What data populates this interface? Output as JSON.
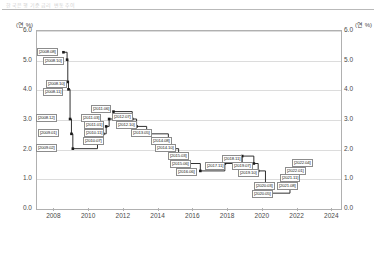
{
  "header": {
    "ghost_text": "한국은행 기준금리 변동추이"
  },
  "axis": {
    "unit_left": "(연 %)",
    "unit_right": "(연 %)",
    "y_ticks": [
      "6.0",
      "5.0",
      "4.0",
      "3.0",
      "2.0",
      "1.0",
      "0.0"
    ],
    "x_ticks": [
      "2008",
      "2010",
      "2012",
      "2014",
      "2016",
      "2018",
      "2020",
      "2022",
      "2024"
    ]
  },
  "chart_data": {
    "type": "line",
    "title": "",
    "subtitle": "",
    "xlabel": "",
    "ylabel": "(연 %)",
    "ylim": [
      0.0,
      6.0
    ],
    "xlim": [
      2007.0,
      2024.5
    ],
    "grid": true,
    "legend": null,
    "step": "post",
    "line_color": "#1a1a1a",
    "marker": "square",
    "series": [
      {
        "name": "한국은행 기준금리",
        "points": [
          {
            "label": "[2008.08]",
            "date": 2008.58,
            "value": 5.25
          },
          {
            "label": "[2008.10]",
            "date": 2008.79,
            "value": 5.0
          },
          {
            "label": "[2008.10]",
            "date": 2008.83,
            "value": 4.25
          },
          {
            "label": "[2008.11]",
            "date": 2008.87,
            "value": 4.0
          },
          {
            "label": "[2008.12]",
            "date": 2008.96,
            "value": 3.0
          },
          {
            "label": "[2009.01]",
            "date": 2009.04,
            "value": 2.5
          },
          {
            "label": "[2009.02]",
            "date": 2009.12,
            "value": 2.0
          },
          {
            "label": "[2010.07]",
            "date": 2010.54,
            "value": 2.25
          },
          {
            "label": "[2010.11]",
            "date": 2010.87,
            "value": 2.5
          },
          {
            "label": "[2011.01]",
            "date": 2011.04,
            "value": 2.75
          },
          {
            "label": "[2011.03]",
            "date": 2011.21,
            "value": 3.0
          },
          {
            "label": "[2011.06]",
            "date": 2011.46,
            "value": 3.25
          },
          {
            "label": "[2012.07]",
            "date": 2012.54,
            "value": 3.0
          },
          {
            "label": "[2012.10]",
            "date": 2012.79,
            "value": 2.75
          },
          {
            "label": "[2013.05]",
            "date": 2013.37,
            "value": 2.5
          },
          {
            "label": "[2014.08]",
            "date": 2014.62,
            "value": 2.25
          },
          {
            "label": "[2014.10]",
            "date": 2014.79,
            "value": 2.0
          },
          {
            "label": "[2015.03]",
            "date": 2015.21,
            "value": 1.75
          },
          {
            "label": "[2015.06]",
            "date": 2015.46,
            "value": 1.5
          },
          {
            "label": "[2016.06]",
            "date": 2016.46,
            "value": 1.25
          },
          {
            "label": "[2017.11]",
            "date": 2017.87,
            "value": 1.5
          },
          {
            "label": "[2018.11]",
            "date": 2018.87,
            "value": 1.75
          },
          {
            "label": "[2019.07]",
            "date": 2019.54,
            "value": 1.5
          },
          {
            "label": "[2019.10]",
            "date": 2019.79,
            "value": 1.25
          },
          {
            "label": "[2020.03]",
            "date": 2020.21,
            "value": 0.75
          },
          {
            "label": "[2020.05]",
            "date": 2020.37,
            "value": 0.5
          },
          {
            "label": "[2021.08]",
            "date": 2021.62,
            "value": 0.75
          },
          {
            "label": "[2021.11]",
            "date": 2021.87,
            "value": 1.0
          },
          {
            "label": "[2022.01]",
            "date": 2022.04,
            "value": 1.25
          },
          {
            "label": "[2022.04]",
            "date": 2022.29,
            "value": 1.5
          }
        ]
      }
    ]
  },
  "annotations": [
    {
      "text": "[2008.08]",
      "x": 37,
      "y": 48
    },
    {
      "text": "[2008.10]",
      "x": 43,
      "y": 57
    },
    {
      "text": "[2008.10]",
      "x": 46,
      "y": 80
    },
    {
      "text": "[2008.11]",
      "x": 43,
      "y": 88
    },
    {
      "text": "[2008.12]",
      "x": 36,
      "y": 114
    },
    {
      "text": "[2009.01]",
      "x": 38,
      "y": 129
    },
    {
      "text": "[2009.02]",
      "x": 36,
      "y": 144
    },
    {
      "text": "[2010.07]",
      "x": 83,
      "y": 137
    },
    {
      "text": "[2010.11]",
      "x": 84,
      "y": 129
    },
    {
      "text": "[2011.01]",
      "x": 84,
      "y": 121
    },
    {
      "text": "[2011.03]",
      "x": 81,
      "y": 114
    },
    {
      "text": "[2011.06]",
      "x": 91,
      "y": 105
    },
    {
      "text": "[2012.07]",
      "x": 112,
      "y": 113
    },
    {
      "text": "[2012.10]",
      "x": 116,
      "y": 121
    },
    {
      "text": "[2013.05]",
      "x": 131,
      "y": 129
    },
    {
      "text": "[2014.08]",
      "x": 151,
      "y": 137
    },
    {
      "text": "[2014.10]",
      "x": 155,
      "y": 144
    },
    {
      "text": "[2015.03]",
      "x": 168,
      "y": 152
    },
    {
      "text": "[2015.06]",
      "x": 170,
      "y": 160
    },
    {
      "text": "[2016.06]",
      "x": 176,
      "y": 168
    },
    {
      "text": "[2017.11]",
      "x": 205,
      "y": 162
    },
    {
      "text": "[2018.11]",
      "x": 222,
      "y": 155
    },
    {
      "text": "[2019.07]",
      "x": 232,
      "y": 162
    },
    {
      "text": "[2019.10]",
      "x": 238,
      "y": 169
    },
    {
      "text": "[2020.03]",
      "x": 254,
      "y": 182
    },
    {
      "text": "[2020.05]",
      "x": 252,
      "y": 190
    },
    {
      "text": "[2021.08]",
      "x": 277,
      "y": 182
    },
    {
      "text": "[2021.11]",
      "x": 280,
      "y": 174
    },
    {
      "text": "[2022.01]",
      "x": 285,
      "y": 167
    },
    {
      "text": "[2022.04]",
      "x": 292,
      "y": 159
    }
  ]
}
